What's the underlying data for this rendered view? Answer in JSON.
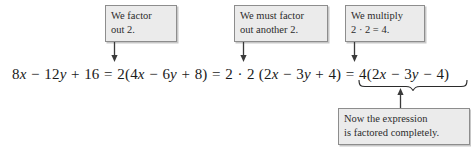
{
  "figure": {
    "kind": "algebra-factoring-annotated-equation",
    "colors": {
      "background": "#ffffff",
      "box_fill": "#ebebeb",
      "box_border": "#8d8d8d",
      "text": "#1a1a1a",
      "arrow": "#3a3a3a"
    }
  },
  "equation": {
    "full_text": "8x − 12y + 16 = 2(4x − 6y + 8) = 2 · 2 (2x − 3y + 4) = 4(2x − 3y − 4)",
    "parts": {
      "original": "8x − 12y + 16",
      "eq1": "=",
      "step1": "2(4x − 6y + 8)",
      "eq2": "=",
      "step2": "2 · 2 (2x − 3y + 4)",
      "eq3": "=",
      "result": "4(2x − 3y − 4)"
    }
  },
  "callouts": {
    "factor_out_2": {
      "line1": "We factor",
      "line2": "out 2."
    },
    "factor_another_2": {
      "line1": "We must factor",
      "line2": "out another 2."
    },
    "multiply": {
      "line1": "We multiply",
      "line2": "2 · 2 = 4."
    },
    "factored_completely": {
      "line1": "Now the expression",
      "line2": "is factored completely."
    }
  },
  "annotations": {
    "arrow_down_1": "arrow-down-to-factor-2",
    "arrow_down_2": "arrow-down-to-second-2",
    "arrow_down_3": "arrow-down-to-4",
    "arrow_up_1": "arrow-up-from-underbrace",
    "underbrace": "underbrace-under-final-expression"
  }
}
